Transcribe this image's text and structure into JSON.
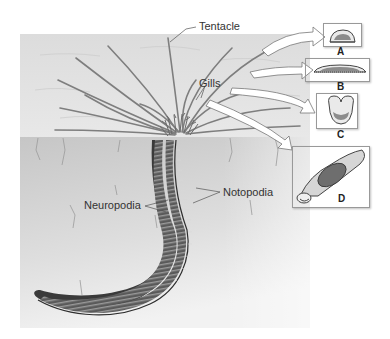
{
  "figure": {
    "labels": {
      "tentacle": "Tentacle",
      "gills": "Gills",
      "notopodia": "Notopodia",
      "neuropodia": "Neuropodia"
    },
    "insets": [
      {
        "letter": "A"
      },
      {
        "letter": "B"
      },
      {
        "letter": "C"
      },
      {
        "letter": "D"
      }
    ],
    "colors": {
      "water": "#e6e6e6",
      "sediment": "#cfcfcf",
      "worm_dark": "#3a3a3a",
      "worm_mid": "#7a7a7a",
      "tentacle": "#8a8a8a",
      "inset_fill": "#8c8c8c"
    }
  }
}
